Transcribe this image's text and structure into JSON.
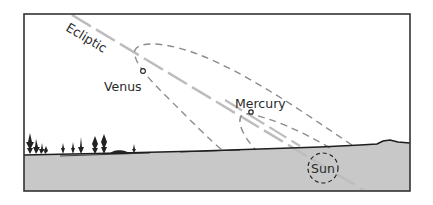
{
  "diagram": {
    "labels": {
      "ecliptic": "Ecliptic",
      "venus": "Venus",
      "mercury": "Mercury",
      "sun": "Sun"
    },
    "colors": {
      "sky": "#ffffff",
      "ground": "#c8c8c8",
      "frame": "#333333",
      "ecliptic": "#bdbdbd",
      "dashed": "#8c8c8c",
      "horizon": "#1e1e1e"
    }
  }
}
